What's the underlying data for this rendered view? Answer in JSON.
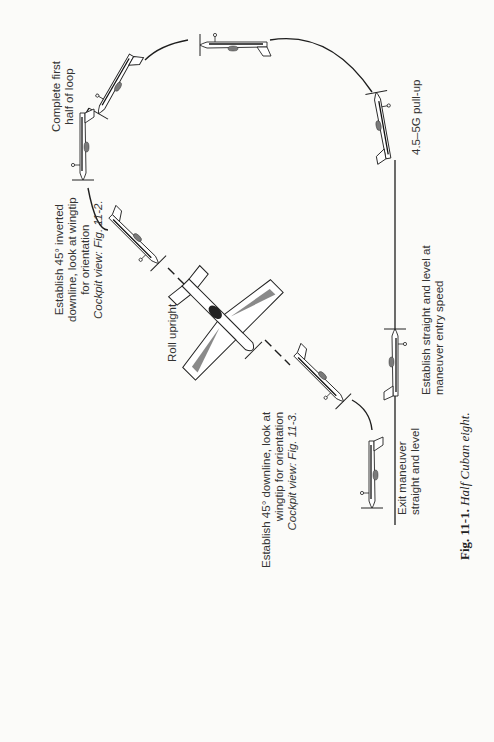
{
  "figure": {
    "number": "Fig. 11-1.",
    "title": "Half Cuban eight.",
    "maneuver": "Half Cuban eight"
  },
  "labels": {
    "complete_first_half": [
      "Complete first",
      "half of loop"
    ],
    "pull_up": [
      "4.5–5G pull-up"
    ],
    "inverted_downline": [
      "Establish 45° inverted",
      "downline, look at wingtip",
      "for orientation",
      "Cockpit view: Fig. 11-2."
    ],
    "roll_upright": [
      "Roll upright"
    ],
    "entry": [
      "Establish straight and level at",
      "maneuver entry speed"
    ],
    "downline": [
      "Establish 45° downline, look at",
      "wingtip for orientation",
      "Cockpit view: Fig. 11-3."
    ],
    "exit": [
      "Exit maneuver",
      "straight and level"
    ]
  },
  "sequence": [
    "Establish straight and level at maneuver entry speed",
    "4.5–5G pull-up",
    "Complete first half of loop",
    "Establish 45° inverted downline, look at wingtip for orientation",
    "Roll upright",
    "Establish 45° downline, look at wingtip for orientation",
    "Exit maneuver straight and level"
  ],
  "colors": {
    "background": "#fbfbf9",
    "line": "#1e1e1e",
    "text": "#333333",
    "shade": "#8a8a8a",
    "canopy": "#222222"
  }
}
